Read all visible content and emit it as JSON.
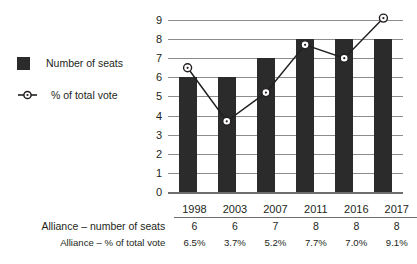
{
  "legend": {
    "items": [
      {
        "label": "Number of seats",
        "marker": "filled-square",
        "color": "#2b2b2b"
      },
      {
        "label": "% of total vote",
        "marker": "line-circle",
        "color": "#231f20"
      }
    ]
  },
  "axis": {
    "y_ticks": [
      "0",
      "1",
      "2",
      "3",
      "4",
      "5",
      "6",
      "7",
      "8",
      "9"
    ]
  },
  "table": {
    "corner": "",
    "years": [
      "1998",
      "2003",
      "2007",
      "2011",
      "2016",
      "2017"
    ],
    "rows": [
      {
        "label": "Alliance – number of seats",
        "values": [
          "6",
          "6",
          "7",
          "8",
          "8",
          "8"
        ]
      },
      {
        "label": "Alliance – % of total vote",
        "values": [
          "6.5%",
          "3.7%",
          "5.2%",
          "7.7%",
          "7.0%",
          "9.1%"
        ]
      }
    ]
  },
  "chart_data": {
    "type": "bar",
    "title": "",
    "xlabel": "",
    "ylabel": "",
    "categories": [
      "1998",
      "2003",
      "2007",
      "2011",
      "2016",
      "2017"
    ],
    "ylim": [
      0,
      9
    ],
    "grid": true,
    "legend_position": "left",
    "series": [
      {
        "name": "Number of seats",
        "type": "bar",
        "color": "#2b2b2b",
        "values": [
          6,
          6,
          7,
          8,
          8,
          8
        ]
      },
      {
        "name": "% of total vote",
        "type": "line",
        "color": "#231f20",
        "marker": "open-circle",
        "values": [
          6.5,
          3.7,
          5.2,
          7.7,
          7.0,
          9.1
        ]
      }
    ]
  }
}
